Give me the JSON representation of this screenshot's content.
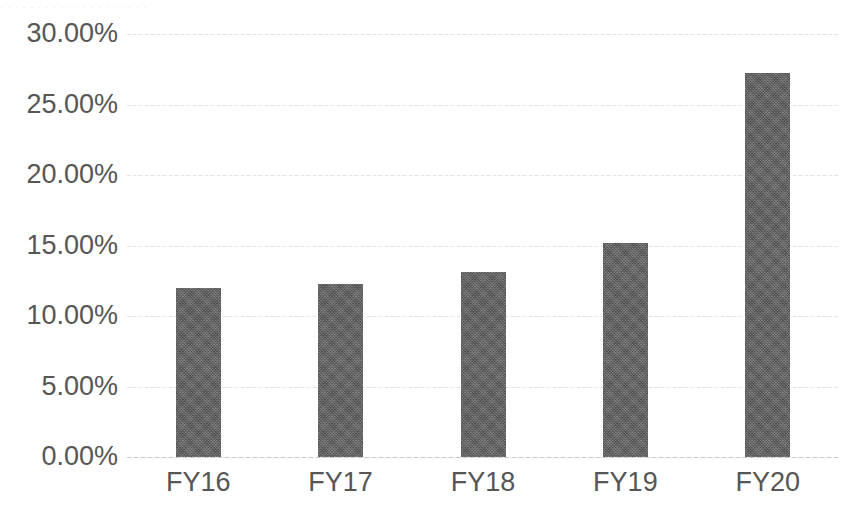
{
  "chart_data": {
    "type": "bar",
    "title": "",
    "subtitle": "",
    "xlabel": "",
    "ylabel": "",
    "categories": [
      "FY16",
      "FY17",
      "FY18",
      "FY19",
      "FY20"
    ],
    "values": [
      12.0,
      12.3,
      13.1,
      15.2,
      27.2
    ],
    "value_format": "percent",
    "ylim": [
      0,
      30
    ],
    "ytick_values": [
      0,
      5,
      10,
      15,
      20,
      25,
      30
    ],
    "ytick_labels": [
      "0.00%",
      "5.00%",
      "10.00%",
      "15.00%",
      "20.00%",
      "25.00%",
      "30.00%"
    ],
    "grid": true,
    "grid_axis": "y",
    "legend": false,
    "legend_position": "none",
    "series": [
      {
        "name": "",
        "values": [
          12.0,
          12.3,
          13.1,
          15.2,
          27.2
        ]
      }
    ],
    "colors": {
      "bar": "#5f5f5f",
      "gridline": "#e2e2e4",
      "baseline": "#c9c9cb",
      "tick_label": "#565656",
      "background": "#ffffff"
    }
  },
  "artifact": {
    "top_strip_text": "·  ·   ·    ·  ·     ·   ·    ·  ·   ·      ·   ·  ·    ·   ·     ·  ·   ·    ·  ·"
  }
}
